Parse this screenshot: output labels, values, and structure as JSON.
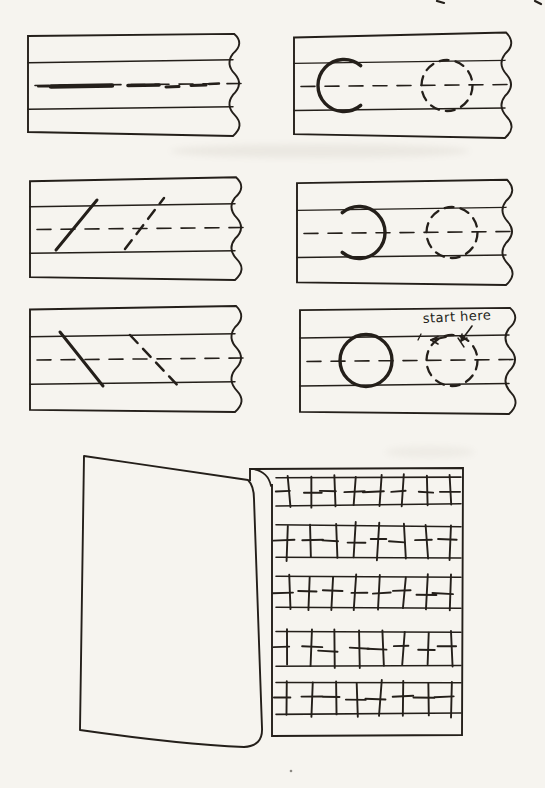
{
  "document": {
    "kind": "scanned-workbook-page",
    "description": "handwriting stroke practice page with six lined writing strips and a folded practice booklet"
  },
  "colors": {
    "ink": "#241f1a",
    "paper": "#f6f4ef",
    "ghost": "#8b8270"
  },
  "panels": [
    {
      "id": "horizontal-strokes",
      "row": 0,
      "col": 0,
      "solid_shape": "thick-horizontal-stroke",
      "traced_shape": "thick-horizontal-dashes",
      "annotation": ""
    },
    {
      "id": "c-open-right",
      "row": 0,
      "col": 1,
      "solid_shape": "letter-c-open-right",
      "traced_shape": "dashed-circle",
      "annotation": ""
    },
    {
      "id": "upward-slant",
      "row": 1,
      "col": 0,
      "solid_shape": "slanted-stroke-up",
      "traced_shape": "dashed-slanted-stroke-up",
      "annotation": ""
    },
    {
      "id": "c-open-left",
      "row": 1,
      "col": 1,
      "solid_shape": "letter-c-open-left",
      "traced_shape": "dashed-circle",
      "annotation": ""
    },
    {
      "id": "downward-slant",
      "row": 2,
      "col": 0,
      "solid_shape": "slanted-stroke-down",
      "traced_shape": "dashed-slanted-stroke-down",
      "annotation": ""
    },
    {
      "id": "circle",
      "row": 2,
      "col": 1,
      "solid_shape": "solid-circle",
      "traced_shape": "dashed-circle",
      "annotation": "start here"
    }
  ],
  "practice_sheet": {
    "rows": 5,
    "vertical_strokes_per_row": 8,
    "dashes_per_row": 8
  },
  "artifacts": {
    "ghost_smudges": true,
    "top_edge_marks": 2
  }
}
